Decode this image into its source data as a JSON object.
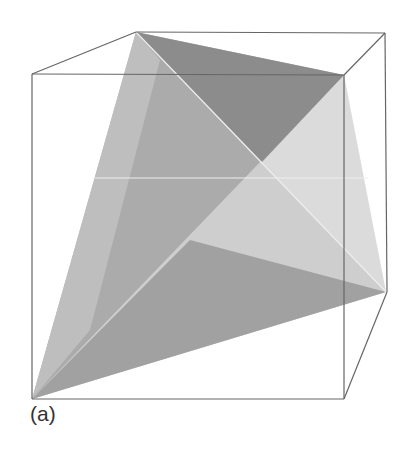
{
  "figure": {
    "label": "(a)",
    "colors": {
      "background": "#ffffff",
      "cube_edge": "#666666",
      "hidden_edge": "#f0f0f0",
      "face_dark": "#8a8a8a",
      "face_medium": "#adadad",
      "face_light": "#c9c9c9",
      "face_lightest": "#d4d4d4"
    },
    "cube": {
      "front_top_left": [
        32,
        74
      ],
      "front_top_right": [
        344,
        75
      ],
      "front_bottom_left": [
        32,
        399
      ],
      "front_bottom_right": [
        344,
        399
      ],
      "back_top_left": [
        136,
        32
      ],
      "back_top_right": [
        385,
        33
      ],
      "back_bottom_right": [
        387,
        292
      ],
      "back_bottom_left": [
        136,
        178
      ]
    },
    "tetrahedron": {
      "A": [
        136,
        32
      ],
      "B": [
        344,
        75
      ],
      "C": [
        386,
        292
      ],
      "D": [
        32,
        399
      ]
    }
  }
}
